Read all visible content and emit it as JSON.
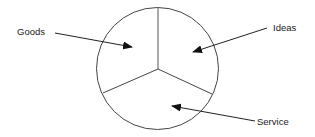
{
  "diagram": {
    "type": "pie-segments",
    "segments": [
      {
        "label": "Goods"
      },
      {
        "label": "Ideas"
      },
      {
        "label": "Service"
      }
    ],
    "colors": {
      "stroke": "#333333",
      "text": "#1a1a1a",
      "background": "#ffffff"
    }
  }
}
